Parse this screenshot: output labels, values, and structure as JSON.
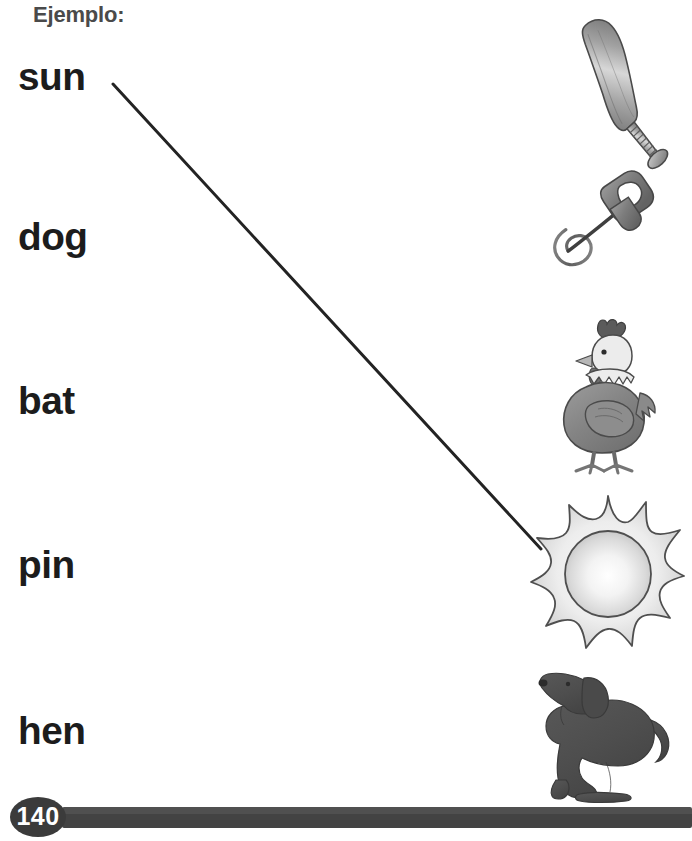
{
  "page": {
    "instruction_label": "Ejemplo:",
    "page_number": "140",
    "background_color": "#ffffff",
    "text_color": "#1c1c1c",
    "label_color": "#4a4a4a",
    "footer_color": "#434343"
  },
  "words": [
    {
      "id": "word-sun",
      "text": "sun",
      "top": 58,
      "matched": true
    },
    {
      "id": "word-dog",
      "text": "dog",
      "top": 218,
      "matched": false
    },
    {
      "id": "word-bat",
      "text": "bat",
      "top": 382,
      "matched": false
    },
    {
      "id": "word-pin",
      "text": "pin",
      "top": 546,
      "matched": false
    },
    {
      "id": "word-hen",
      "text": "hen",
      "top": 712,
      "matched": false
    }
  ],
  "pictures": [
    {
      "id": "picture-bat",
      "icon": "baseball-bat-icon",
      "alt": "baseball bat",
      "top": 10,
      "left": 528
    },
    {
      "id": "picture-safetypin",
      "icon": "safety-pin-icon",
      "alt": "safety pin",
      "top": 163,
      "left": 528
    },
    {
      "id": "picture-hen",
      "icon": "hen-icon",
      "alt": "hen",
      "top": 313,
      "left": 528
    },
    {
      "id": "picture-sun",
      "icon": "sun-icon",
      "alt": "sun",
      "top": 492,
      "left": 528
    },
    {
      "id": "picture-dog",
      "icon": "dog-icon",
      "alt": "dog",
      "top": 662,
      "left": 528
    }
  ],
  "connections": [
    {
      "id": "connector-sun",
      "from": "word-sun",
      "to": "picture-sun",
      "x1": 113,
      "y1": 84,
      "x2": 541,
      "y2": 549,
      "color": "#232323",
      "width": 3
    }
  ]
}
